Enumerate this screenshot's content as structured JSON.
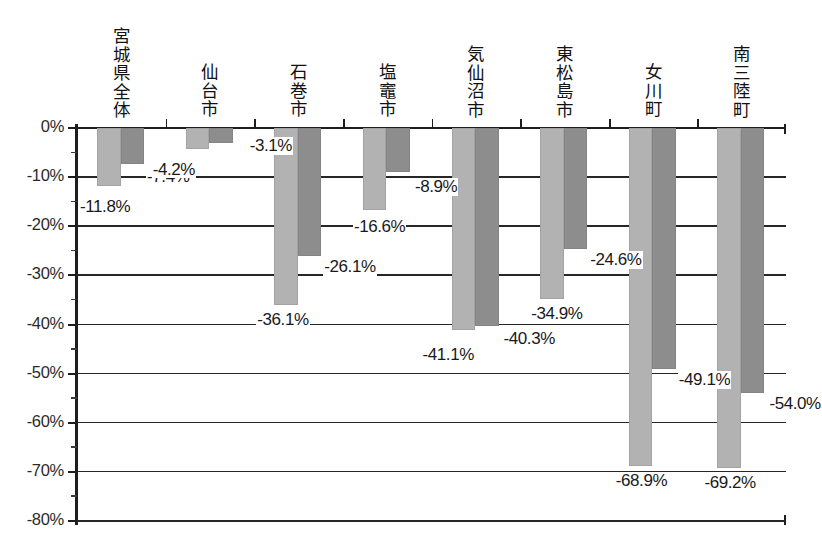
{
  "chart_data": {
    "type": "bar",
    "title": "",
    "subtitle": "",
    "xlabel": "",
    "ylabel": "",
    "ylim": [
      -80,
      0
    ],
    "ytick_labels": [
      "0%",
      "-10%",
      "-20%",
      "-30%",
      "-40%",
      "-50%",
      "-60%",
      "-70%",
      "-80%"
    ],
    "ytick_values": [
      0,
      -10,
      -20,
      -30,
      -40,
      -50,
      -60,
      -70,
      -80
    ],
    "grid": true,
    "legend": "none",
    "categories": [
      "宮城県全体",
      "仙台市",
      "石巻市",
      "塩竈市",
      "気仙沼市",
      "東松島市",
      "女川町",
      "南三陸町"
    ],
    "series": [
      {
        "name": "series-light",
        "color": "#b2b2b2",
        "values": [
          -11.8,
          -4.2,
          -36.1,
          -16.6,
          -41.1,
          -34.9,
          -68.9,
          -69.2
        ],
        "labels": [
          "-11.8%",
          "-4.2%",
          "-36.1%",
          "-16.6%",
          "-41.1%",
          "-34.9%",
          "-68.9%",
          "-69.2%"
        ]
      },
      {
        "name": "series-dark",
        "color": "#8d8d8d",
        "values": [
          -7.4,
          -3.1,
          -26.1,
          -8.9,
          -40.3,
          -24.6,
          -49.1,
          -54.0
        ],
        "labels": [
          "-7.4%",
          "-3.1%",
          "-26.1%",
          "-8.9%",
          "-40.3%",
          "-24.6%",
          "-49.1%",
          "-54.0%"
        ]
      }
    ]
  },
  "axis": {
    "y": {
      "t0": "0%",
      "t1": "-10%",
      "t2": "-20%",
      "t3": "-30%",
      "t4": "-40%",
      "t5": "-50%",
      "t6": "-60%",
      "t7": "-70%",
      "t8": "-80%"
    }
  },
  "categories": {
    "c0": "宮城県全体",
    "c1": "仙台市",
    "c2": "石巻市",
    "c3": "塩竈市",
    "c4": "気仙沼市",
    "c5": "東松島市",
    "c6": "女川町",
    "c7": "南三陸町"
  },
  "values": {
    "light": {
      "v0": "-11.8%",
      "v1": "-4.2%",
      "v2": "-36.1%",
      "v3": "-16.6%",
      "v4": "-41.1%",
      "v5": "-34.9%",
      "v6": "-68.9%",
      "v7": "-69.2%"
    },
    "dark": {
      "v0": "-7.4%",
      "v1": "-3.1%",
      "v2": "-26.1%",
      "v3": "-8.9%",
      "v4": "-40.3%",
      "v5": "-24.6%",
      "v6": "-49.1%",
      "v7": "-54.0%"
    }
  },
  "colors": {
    "light_bar": "#b2b2b2",
    "dark_bar": "#8d8d8d",
    "axis": "#1d1d1d",
    "background": "#ffffff"
  }
}
